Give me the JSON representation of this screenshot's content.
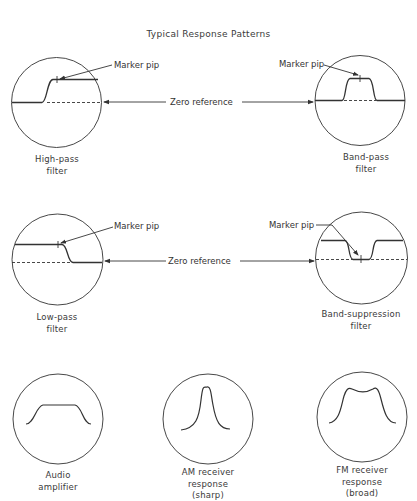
{
  "title": "Typical Response Patterns",
  "annotations": {
    "marker_pip": "Marker pip",
    "zero_reference": "Zero reference"
  },
  "patterns": [
    {
      "id": "high-pass",
      "label_lines": [
        "High-pass",
        "filter"
      ]
    },
    {
      "id": "band-pass",
      "label_lines": [
        "Band-pass",
        "filter"
      ]
    },
    {
      "id": "low-pass",
      "label_lines": [
        "Low-pass",
        "filter"
      ]
    },
    {
      "id": "band-suppression",
      "label_lines": [
        "Band-suppression",
        "filter"
      ]
    },
    {
      "id": "audio-amplifier",
      "label_lines": [
        "Audio",
        "amplifier"
      ]
    },
    {
      "id": "am-receiver",
      "label_lines": [
        "AM receiver",
        "response",
        "(sharp)"
      ]
    },
    {
      "id": "fm-receiver",
      "label_lines": [
        "FM receiver",
        "response",
        "(broad)"
      ]
    }
  ],
  "colors": {
    "line": "#333333",
    "background": "#ffffff"
  }
}
